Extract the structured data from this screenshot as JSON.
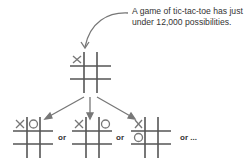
{
  "caption": {
    "line1": "A game of tic-tac-toe has just",
    "line2": "under 12,000 possibilities."
  },
  "connectors": [
    "or",
    "or",
    "or ..."
  ],
  "colors": {
    "grid": "#555555",
    "marks": "#777777",
    "text": "#333333"
  },
  "boards": [
    {
      "name": "start-board",
      "cells": [
        "X",
        "",
        "",
        "",
        "",
        "",
        "",
        "",
        ""
      ]
    },
    {
      "name": "option-1",
      "cells": [
        "X",
        "O",
        "",
        "",
        "",
        "",
        "",
        "",
        ""
      ]
    },
    {
      "name": "option-2",
      "cells": [
        "X",
        "",
        "O",
        "",
        "",
        "",
        "",
        "",
        ""
      ]
    },
    {
      "name": "option-3",
      "cells": [
        "X",
        "",
        "",
        "O",
        "",
        "",
        "",
        "",
        ""
      ]
    }
  ]
}
